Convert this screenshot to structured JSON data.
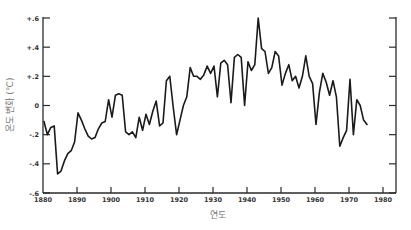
{
  "chart_data": {
    "type": "line",
    "title": "",
    "xlabel": "연도",
    "ylabel": "온도 변화 (℃)",
    "xlim": [
      1880,
      1980
    ],
    "ylim": [
      -0.6,
      0.6
    ],
    "grid": false,
    "legend": null,
    "x_ticks": [
      "1880",
      "1890",
      "1900",
      "1910",
      "1920",
      "1930",
      "1940",
      "1950",
      "1960",
      "1970",
      "1980"
    ],
    "y_ticks": [
      "+.6",
      "+.4",
      "+.2",
      "0",
      "-.2",
      "-.4",
      "-.6"
    ],
    "x": [
      1880,
      1881,
      1882,
      1883,
      1884,
      1885,
      1886,
      1887,
      1888,
      1889,
      1890,
      1891,
      1892,
      1893,
      1894,
      1895,
      1896,
      1897,
      1898,
      1899,
      1900,
      1901,
      1902,
      1903,
      1904,
      1905,
      1906,
      1907,
      1908,
      1909,
      1910,
      1911,
      1912,
      1913,
      1914,
      1915,
      1916,
      1917,
      1918,
      1919,
      1920,
      1921,
      1922,
      1923,
      1924,
      1925,
      1926,
      1927,
      1928,
      1929,
      1930,
      1931,
      1932,
      1933,
      1934,
      1935,
      1936,
      1937,
      1938,
      1939,
      1940,
      1941,
      1942,
      1943,
      1944,
      1945,
      1946,
      1947,
      1948,
      1949,
      1950,
      1951,
      1952,
      1953,
      1954,
      1955,
      1956,
      1957,
      1958,
      1959,
      1960,
      1961,
      1962,
      1963,
      1964,
      1965,
      1966,
      1967,
      1968,
      1969,
      1970,
      1971,
      1972,
      1973,
      1974,
      1975
    ],
    "series": [
      {
        "name": "온도 변화",
        "values": [
          -0.11,
          -0.2,
          -0.15,
          -0.14,
          -0.47,
          -0.45,
          -0.38,
          -0.33,
          -0.31,
          -0.25,
          -0.05,
          -0.1,
          -0.16,
          -0.21,
          -0.23,
          -0.22,
          -0.16,
          -0.12,
          -0.11,
          0.04,
          -0.08,
          0.07,
          0.08,
          0.07,
          -0.18,
          -0.2,
          -0.18,
          -0.22,
          -0.08,
          -0.17,
          -0.06,
          -0.13,
          -0.04,
          0.03,
          -0.14,
          -0.12,
          0.17,
          0.2,
          -0.01,
          -0.2,
          -0.1,
          0.0,
          0.06,
          0.26,
          0.2,
          0.2,
          0.18,
          0.21,
          0.27,
          0.22,
          0.27,
          0.06,
          0.29,
          0.31,
          0.28,
          0.02,
          0.33,
          0.35,
          0.33,
          0.0,
          0.3,
          0.24,
          0.28,
          0.6,
          0.39,
          0.37,
          0.22,
          0.26,
          0.37,
          0.34,
          0.14,
          0.22,
          0.28,
          0.17,
          0.2,
          0.12,
          0.2,
          0.34,
          0.2,
          0.15,
          -0.13,
          0.09,
          0.22,
          0.16,
          0.07,
          0.17,
          0.06,
          -0.28,
          -0.22,
          -0.17,
          0.18,
          -0.2,
          0.04,
          0.0,
          -0.1,
          -0.13
        ]
      }
    ]
  },
  "axes": {
    "y_title": "온도 변화 (℃)",
    "x_title": "연도"
  }
}
